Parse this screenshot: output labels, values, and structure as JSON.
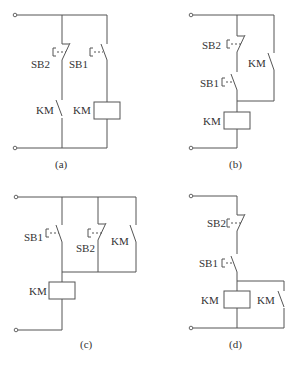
{
  "diagrams": [
    {
      "id": "a",
      "caption": "(a)",
      "labels": {
        "sb2": "SB2",
        "sb1": "SB1",
        "km_contact": "KM",
        "km_coil": "KM"
      }
    },
    {
      "id": "b",
      "caption": "(b)",
      "labels": {
        "sb2": "SB2",
        "sb1": "SB1",
        "km_contact": "KM",
        "km_coil": "KM"
      }
    },
    {
      "id": "c",
      "caption": "(c)",
      "labels": {
        "sb1": "SB1",
        "sb2": "SB2",
        "km_contact": "KM",
        "km_coil": "KM"
      }
    },
    {
      "id": "d",
      "caption": "(d)",
      "labels": {
        "sb2": "SB2",
        "sb1": "SB1",
        "km_contact": "KM",
        "km_coil": "KM"
      }
    }
  ],
  "legend": {
    "SB1": "start push-button (normally open)",
    "SB2": "stop push-button (normally closed)",
    "KM": "contactor coil / auxiliary contact"
  }
}
